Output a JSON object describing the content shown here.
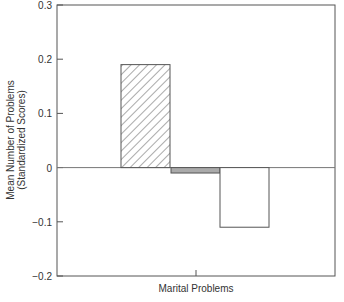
{
  "chart_data": {
    "type": "bar",
    "title": "",
    "xlabel": "Marital Problems",
    "ylabel": "Mean Number of Problems",
    "ylabel_line2": "(Standardized Scores)",
    "categories": [
      "Marital Problems"
    ],
    "series": [
      {
        "name": "Group 1 (hatched)",
        "values": [
          0.19
        ],
        "pattern": "diagonal-hatch",
        "color": "#ffffff"
      },
      {
        "name": "Group 2 (gray)",
        "values": [
          -0.01
        ],
        "pattern": "solid",
        "color": "#aaaaaa"
      },
      {
        "name": "Group 3 (white)",
        "values": [
          -0.11
        ],
        "pattern": "solid",
        "color": "#ffffff"
      }
    ],
    "ylim": [
      -0.2,
      0.3
    ],
    "yticks": [
      -0.2,
      -0.1,
      0,
      0.1,
      0.2,
      0.3
    ],
    "ytick_labels": [
      "−0.2",
      "−0.1",
      "0",
      "0.1",
      "0.2",
      "0.3"
    ],
    "grid": false,
    "legend": "none",
    "zero_line": true
  }
}
